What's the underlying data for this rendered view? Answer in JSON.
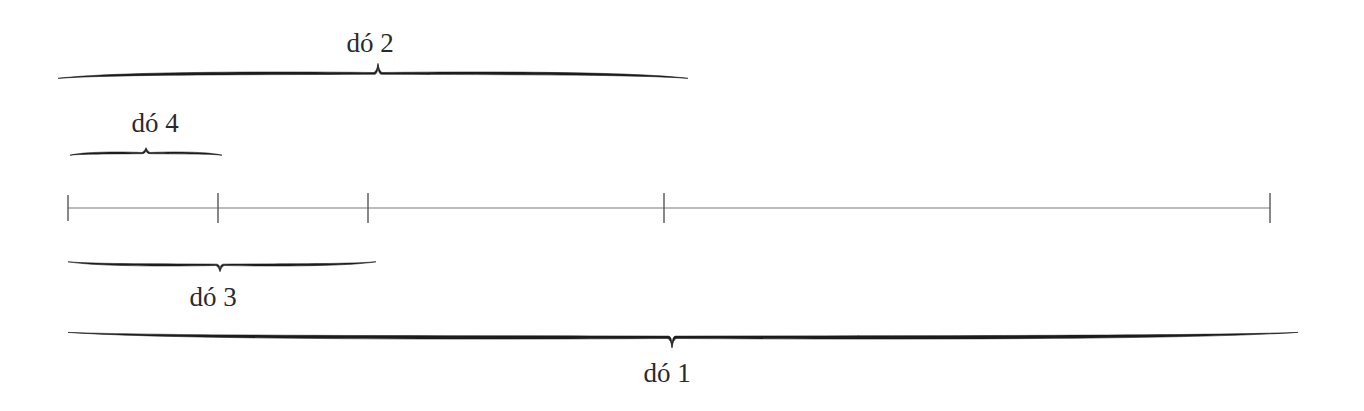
{
  "diagram": {
    "line": {
      "y": 208,
      "x_start": 68,
      "x_end": 1270
    },
    "ticks": [
      68,
      218,
      368,
      664,
      1270
    ],
    "braces": [
      {
        "id": "do2",
        "label": "dó 2",
        "position": "above",
        "x1": 58,
        "x2": 688,
        "y": 72,
        "tip_x": 378,
        "label_x": 370,
        "label_y": 52
      },
      {
        "id": "do4",
        "label": "dó 4",
        "position": "above",
        "x1": 70,
        "x2": 222,
        "y": 152,
        "tip_x": 146,
        "label_x": 155,
        "label_y": 132
      },
      {
        "id": "do3",
        "label": "dó 3",
        "position": "below",
        "x1": 68,
        "x2": 376,
        "y": 266,
        "tip_x": 220,
        "label_x": 213,
        "label_y": 306
      },
      {
        "id": "do1",
        "label": "dó 1",
        "position": "below",
        "x1": 68,
        "x2": 1298,
        "y": 339,
        "tip_x": 672,
        "label_x": 667,
        "label_y": 382
      }
    ],
    "colors": {
      "brace": "#1c1c1c",
      "line": "#7a7a7a",
      "text": "#2a2a2a",
      "background": "#ffffff"
    }
  }
}
